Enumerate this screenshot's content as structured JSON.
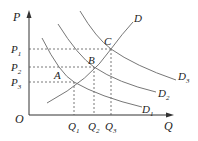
{
  "axes": {
    "y_label": "P",
    "x_label": "Q",
    "origin_label": "O"
  },
  "price_levels": [
    {
      "label": "P",
      "sub": "1",
      "y": 49
    },
    {
      "label": "P",
      "sub": "2",
      "y": 67
    },
    {
      "label": "P",
      "sub": "3",
      "y": 82
    }
  ],
  "quantity_levels": [
    {
      "label": "Q",
      "sub": "1",
      "x": 74
    },
    {
      "label": "Q",
      "sub": "2",
      "x": 94
    },
    {
      "label": "Q",
      "sub": "3",
      "x": 111
    }
  ],
  "points": [
    {
      "label": "A",
      "x": 74,
      "y": 82
    },
    {
      "label": "B",
      "x": 94,
      "y": 67
    },
    {
      "label": "C",
      "x": 111,
      "y": 49
    }
  ],
  "curves": {
    "supply": {
      "label": "D"
    },
    "demand": [
      {
        "label": "D",
        "sub": "1"
      },
      {
        "label": "D",
        "sub": "2"
      },
      {
        "label": "D",
        "sub": "3"
      }
    ]
  },
  "colors": {
    "axis": "#333333",
    "curve": "#777777",
    "dashed": "#555555"
  }
}
